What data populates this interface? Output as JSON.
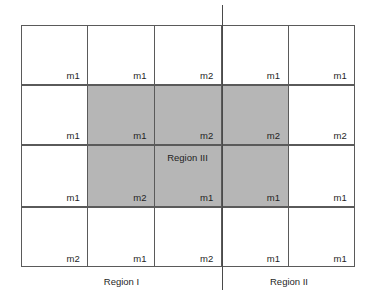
{
  "figure": {
    "name": "region-partition-grid",
    "grid": {
      "columns": 5,
      "rows": 4,
      "cells": [
        [
          "m1",
          "m1",
          "m2",
          "m1",
          "m1"
        ],
        [
          "m1",
          "m1",
          "m2",
          "m2",
          "m2"
        ],
        [
          "m1",
          "m2",
          "m1",
          "m1",
          "m1"
        ],
        [
          "m2",
          "m1",
          "m2",
          "m1",
          "m1"
        ]
      ]
    },
    "shaded_region": {
      "label": "Region III",
      "color": "#b6b6b6",
      "covers_columns": [
        2,
        3,
        4
      ],
      "covers_rows": [
        2,
        3
      ]
    },
    "captions": {
      "left": "Region I",
      "right": "Region II"
    },
    "colors": {
      "line": "#5a5a5a",
      "divider": "#4a4a4a",
      "shade": "#b6b6b6",
      "background": "#ffffff",
      "text": "#1f1f1f"
    }
  }
}
